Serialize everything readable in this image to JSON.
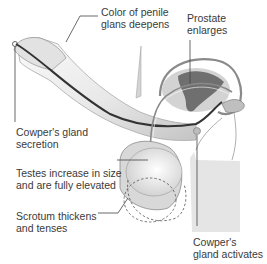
{
  "diagram": {
    "labels": {
      "glans": "Color of penile\nglans deepens",
      "prostate": "Prostate\nenlarges",
      "cowper_secretion": "Cowper's gland\nsecretion",
      "testes": "Testes increase in size\nand are fully elevated",
      "scrotum": "Scrotum thickens\nand tenses",
      "cowper_activates": "Cowper's\ngland activates"
    },
    "colors": {
      "leader": "#444444",
      "shaft_light": "#f2f2f2",
      "shaft_shadow": "#c9c9c9",
      "urethra": "#333333",
      "prostate_fill": "#b9b9b9",
      "prostate_dark": "#6f6f6f",
      "body_fill": "#e6e6e6",
      "outline": "#8a8a8a"
    }
  }
}
